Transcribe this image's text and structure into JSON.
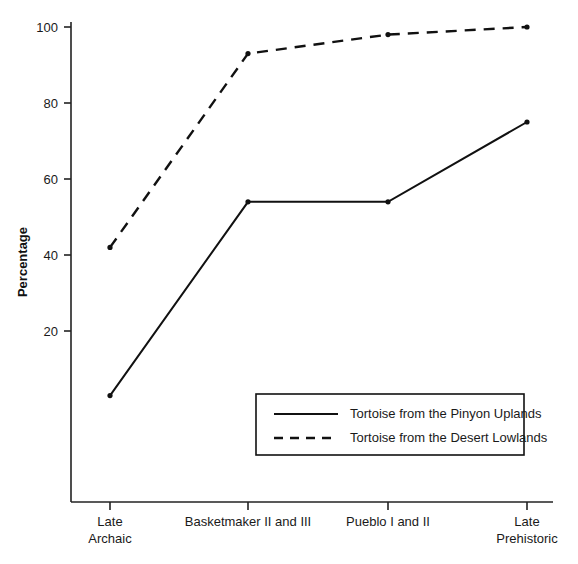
{
  "chart_data": {
    "type": "line",
    "title": "",
    "xlabel": "",
    "ylabel": "Percentage",
    "categories": [
      "Late\nArchaic",
      "Basketmaker II and III",
      "Pueblo I and II",
      "Late\nPrehistoric"
    ],
    "category_lines": [
      [
        "Late",
        "Archaic"
      ],
      [
        "Basketmaker II and III"
      ],
      [
        "Pueblo I and II"
      ],
      [
        "Late",
        "Prehistoric"
      ]
    ],
    "series": [
      {
        "name": "Tortoise from the Pinyon Uplands",
        "style": "solid",
        "values": [
          3,
          54,
          54,
          75
        ]
      },
      {
        "name": "Tortoise from the Desert Lowlands",
        "style": "dashed",
        "values": [
          42,
          93,
          98,
          100
        ]
      }
    ],
    "ylim": [
      0,
      104
    ],
    "yticks": [
      20,
      40,
      60,
      80,
      100
    ],
    "ytick_labels": [
      "20",
      "40",
      "60",
      "80",
      "100"
    ],
    "grid": false,
    "legend_position": "inside-lower-right",
    "line_color": "#111111"
  },
  "legend": {
    "entries": [
      {
        "label": "Tortoise from the Pinyon Uplands",
        "style": "solid"
      },
      {
        "label": "Tortoise from the Desert Lowlands",
        "style": "dashed"
      }
    ]
  },
  "axes": {
    "y_title": "Percentage"
  }
}
